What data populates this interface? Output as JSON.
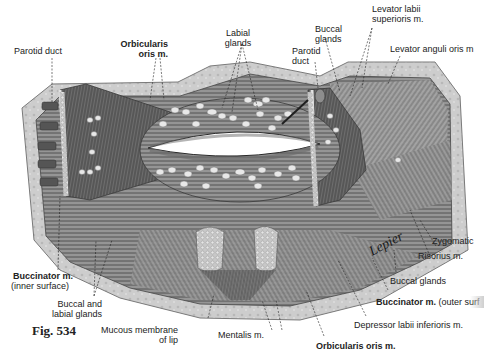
{
  "figure": {
    "number_label": "Fig. 534",
    "signature": "Lepier",
    "colors": {
      "background": "#ffffff",
      "skin_border": "#c9c9c9",
      "muscle_dark": "#5a5a5a",
      "muscle_mid": "#8a8a8a",
      "gland": "#e6e6e6"
    }
  },
  "labels": {
    "parotid_duct_left": "Parotid duct",
    "orbicularis_top_1": "Orbicularis",
    "orbicularis_top_2": "oris m.",
    "labial_glands_1": "Labial",
    "labial_glands_2": "glands",
    "buccal_glands_top_1": "Buccal",
    "buccal_glands_top_2": "glands",
    "parotid_duct_right_1": "Parotid",
    "parotid_duct_right_2": "duct",
    "levator_labii_1": "Levator labii",
    "levator_labii_2": "superioris m.",
    "levator_anguli": "Levator anguli oris m",
    "zygomatic": "Zygomatic",
    "risorius": "Risorius m.",
    "buccal_glands_right": "Buccal glands",
    "buccinator_outer_bold": "Buccinator m.",
    "buccinator_outer_rest": "(outer surf",
    "depressor_labii": "Depressor labii inferioris m.",
    "orbicularis_bottom": "Orbicularis oris m.",
    "mentalis": "Mentalis m.",
    "mucous_membrane_1": "Mucous membrane",
    "mucous_membrane_2": "of lip",
    "buccal_labial_1": "Buccal and",
    "buccal_labial_2": "labial glands",
    "buccinator_inner_1": "Buccinator m.",
    "buccinator_inner_2": "(inner surface)"
  }
}
